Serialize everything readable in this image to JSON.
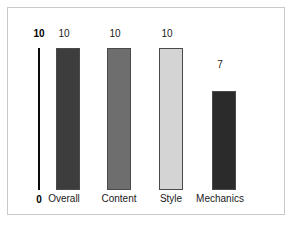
{
  "chart_data": {
    "type": "bar",
    "title": "",
    "subtitle": "",
    "xlabel": "",
    "ylabel": "",
    "ylim": [
      0,
      10
    ],
    "grid": false,
    "legend": false,
    "axis_ticks": [
      "10",
      "0"
    ],
    "axis_tick_top": "10",
    "axis_tick_bottom": "0",
    "categories": [
      "Overall",
      "Content",
      "Style",
      "Mechanics"
    ],
    "values": [
      10,
      10,
      10,
      7
    ],
    "value_labels": [
      "10",
      "10",
      "10",
      "7"
    ],
    "bar_colors": [
      "#3d3d3d",
      "#6e6e6e",
      "#d4d4d4",
      "#2b2b2b"
    ],
    "bar_border_color": "#4a4a4a",
    "axis_color": "#0b0b0b",
    "frame_color": "#c9c9c9",
    "background_color": "#ffffff"
  }
}
